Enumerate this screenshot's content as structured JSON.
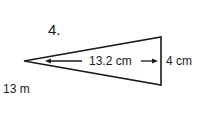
{
  "problem": {
    "number": "4.",
    "labels": {
      "length": "13.2 cm",
      "side": "4 cm",
      "base_note": "13 m"
    },
    "shape": "isosceles-triangle",
    "vertices": {
      "apex": [
        24,
        61
      ],
      "top_right": [
        161,
        37
      ],
      "bottom_right": [
        161,
        85
      ]
    }
  }
}
